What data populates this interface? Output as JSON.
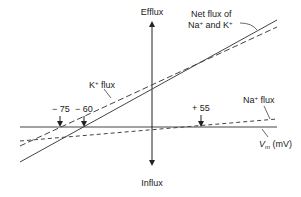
{
  "diagram": {
    "type": "current-voltage relationship",
    "axes": {
      "vertical_top_label": "Efflux",
      "vertical_bottom_label": "Influx",
      "horizontal_label_main": "V",
      "horizontal_label_sub": "m",
      "horizontal_label_unit": " (mV)"
    },
    "curves": [
      {
        "id": "k-flux",
        "label_main": "K",
        "label_sup": "+",
        "label_rest": " flux",
        "style": "solid"
      },
      {
        "id": "net-flux",
        "label_line1": "Net flux of",
        "label_line2_a": "Na",
        "label_line2_sup1": "+",
        "label_line2_b": " and K",
        "label_line2_sup2": "+",
        "style": "dashed"
      },
      {
        "id": "na-flux",
        "label_main": "Na",
        "label_sup": "+",
        "label_rest": " flux",
        "style": "dashed"
      }
    ],
    "markers": [
      {
        "label": "− 75",
        "value_mV": -75,
        "meaning": "K+ equilibrium potential"
      },
      {
        "label": "− 60",
        "value_mV": -60,
        "meaning": "resting potential (net flux zero)"
      },
      {
        "label": "+ 55",
        "value_mV": 55,
        "meaning": "Na+ equilibrium potential"
      }
    ],
    "colors": {
      "line": "#333333",
      "text": "#222222",
      "background": "#ffffff"
    }
  }
}
